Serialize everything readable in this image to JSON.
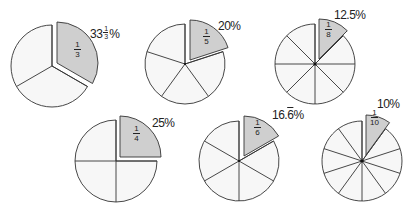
{
  "title": "",
  "colors": {
    "slice_fill": "#f7f7f7",
    "highlight_fill": "#cfcfcf",
    "stroke": "#333333",
    "center_dot": "#111111"
  },
  "pies": [
    {
      "id": "thirds",
      "divisions": 3,
      "cx": 52,
      "cy": 66,
      "r": 41,
      "explode_dx": 5,
      "explode_dy": -3,
      "fraction": {
        "numerator": "1",
        "denominator": "3"
      },
      "percent_label": {
        "whole": "33",
        "frac_num": "1",
        "frac_den": "3",
        "suffix": "%"
      },
      "label_x": 90,
      "label_y": 27,
      "frac_x": 74,
      "frac_y": 40
    },
    {
      "id": "fifths",
      "divisions": 5,
      "cx": 185,
      "cy": 64,
      "r": 40,
      "explode_dx": 5,
      "explode_dy": -4,
      "fraction": {
        "numerator": "1",
        "denominator": "5"
      },
      "percent_label": {
        "text": "20%"
      },
      "label_x": 218,
      "label_y": 20,
      "frac_x": 203,
      "frac_y": 27
    },
    {
      "id": "eighths",
      "divisions": 8,
      "cx": 315,
      "cy": 64,
      "r": 40,
      "explode_dx": 4,
      "explode_dy": -5,
      "fraction": {
        "numerator": "1",
        "denominator": "8"
      },
      "percent_label": {
        "text": "12.5%"
      },
      "label_x": 334,
      "label_y": 9,
      "frac_x": 325,
      "frac_y": 20
    },
    {
      "id": "quarters",
      "divisions": 4,
      "cx": 116,
      "cy": 161,
      "r": 41,
      "explode_dx": 4,
      "explode_dy": -4,
      "fraction": {
        "numerator": "1",
        "denominator": "4"
      },
      "percent_label": {
        "text": "25%"
      },
      "label_x": 152,
      "label_y": 117,
      "frac_x": 133,
      "frac_y": 124
    },
    {
      "id": "sixths",
      "divisions": 6,
      "cx": 239,
      "cy": 161,
      "r": 40,
      "explode_dx": 5,
      "explode_dy": -5,
      "fraction": {
        "numerator": "1",
        "denominator": "6"
      },
      "percent_label": {
        "text": "16.6",
        "overline_digit": "6",
        "suffix": "%"
      },
      "label_x": 272,
      "label_y": 109,
      "frac_x": 254,
      "frac_y": 118
    },
    {
      "id": "tenths",
      "divisions": 10,
      "cx": 362,
      "cy": 161,
      "r": 40,
      "explode_dx": 4,
      "explode_dy": -6,
      "fraction": {
        "numerator": "1",
        "denominator": "10"
      },
      "percent_label": {
        "text": "10%"
      },
      "label_x": 377,
      "label_y": 98,
      "frac_x": 370,
      "frac_y": 108
    }
  ]
}
